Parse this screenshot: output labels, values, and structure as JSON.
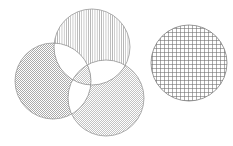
{
  "figure": {
    "title": "Four hatched circles diagram",
    "background_color": "#ffffff",
    "width": 233,
    "height": 146,
    "fill_rule": "evenodd",
    "outline_color": "#8a8a8a",
    "outline_width": 0.7
  },
  "chart_data": {
    "type": "diagram",
    "subtype": "venn-hatched-circles",
    "title": "Four hatched circles diagram",
    "units": "pixels",
    "fill_rule": "evenodd",
    "groups": [
      {
        "name": "overlapping-cluster",
        "label": "Overlapping cluster",
        "member_ids": [
          "circle-top",
          "circle-left",
          "circle-bottom-right"
        ]
      },
      {
        "name": "standalone",
        "label": "Standalone circle",
        "member_ids": [
          "circle-right"
        ]
      }
    ],
    "circles": [
      {
        "id": "circle-top",
        "label": "Top circle",
        "cx": 92,
        "cy": 47,
        "r": 38,
        "pattern": "vertical-lines",
        "pattern_label": "Vertical line hatch",
        "pattern_spacing": 2.2,
        "pattern_color": "#9a9a9a",
        "stroke": "#8a8a8a",
        "stroke_width": 0.7
      },
      {
        "id": "circle-left",
        "label": "Left circle",
        "cx": 53,
        "cy": 81,
        "r": 38,
        "pattern": "fine-checker-dots",
        "pattern_label": "Fine dotted checker hatch",
        "pattern_spacing": 2.0,
        "pattern_color": "#a6a6a6",
        "stroke": "#8a8a8a",
        "stroke_width": 0.7
      },
      {
        "id": "circle-bottom-right",
        "label": "Bottom right circle",
        "cx": 106,
        "cy": 98,
        "r": 38,
        "pattern": "diagonal-lines-up",
        "pattern_label": "Diagonal hatch rising to the right",
        "pattern_spacing": 2.0,
        "pattern_color": "#9e9e9e",
        "stroke": "#8a8a8a",
        "stroke_width": 0.7
      },
      {
        "id": "circle-right",
        "label": "Right standalone circle",
        "cx": 189,
        "cy": 63,
        "r": 38,
        "pattern": "cross-hatch-grid",
        "pattern_label": "Cross-hatch grid",
        "pattern_spacing": 4.0,
        "pattern_color": "#6d6d6d",
        "stroke": "#6f6f6f",
        "stroke_width": 0.7
      }
    ],
    "intersections": [
      {
        "id": "overlap-top-left",
        "label": "Top and left overlap",
        "members": [
          "circle-top",
          "circle-left"
        ],
        "fill": "#ffffff"
      },
      {
        "id": "overlap-top-bottomright",
        "label": "Top and bottom-right overlap",
        "members": [
          "circle-top",
          "circle-bottom-right"
        ],
        "fill": "#ffffff"
      },
      {
        "id": "overlap-left-bottomright",
        "label": "Left and bottom-right overlap",
        "members": [
          "circle-left",
          "circle-bottom-right"
        ],
        "fill": "#ffffff"
      },
      {
        "id": "overlap-all-three",
        "label": "Center triple overlap",
        "members": [
          "circle-top",
          "circle-left",
          "circle-bottom-right"
        ],
        "fill": "#d8d8d8"
      }
    ]
  }
}
